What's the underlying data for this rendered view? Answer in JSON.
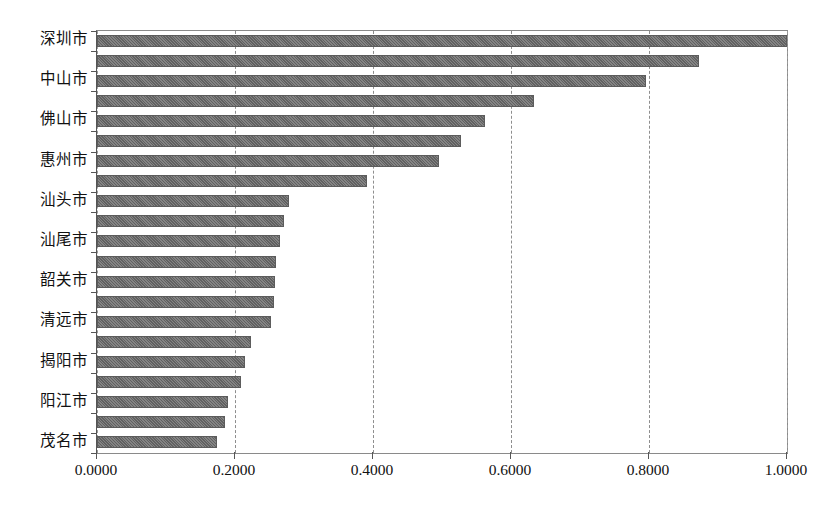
{
  "chart_data": {
    "type": "bar",
    "orientation": "horizontal",
    "title": "",
    "xlabel": "",
    "ylabel": "",
    "xlim": [
      0.0,
      1.0
    ],
    "grid": true,
    "grid_axis": "x",
    "legend": null,
    "bar_color": "#6c6c6c",
    "xticks": [
      0.0,
      0.2,
      0.4,
      0.6,
      0.8,
      1.0
    ],
    "xticklabels": [
      "0.0000",
      "0.2000",
      "0.4000",
      "0.6000",
      "0.8000",
      "1.0000"
    ],
    "yticklabels_visible": [
      "深圳市",
      "中山市",
      "佛山市",
      "惠州市",
      "汕头市",
      "汕尾市",
      "韶关市",
      "清远市",
      "揭阳市",
      "阳江市",
      "茂名市"
    ],
    "categories": [
      "深圳市",
      "",
      "中山市",
      "",
      "佛山市",
      "",
      "惠州市",
      "",
      "汕头市",
      "",
      "汕尾市",
      "",
      "韶关市",
      "",
      "清远市",
      "",
      "揭阳市",
      "",
      "阳江市",
      "",
      "茂名市"
    ],
    "values": [
      1.0,
      0.873,
      0.795,
      0.633,
      0.562,
      0.528,
      0.496,
      0.392,
      0.278,
      0.271,
      0.265,
      0.259,
      0.258,
      0.256,
      0.252,
      0.223,
      0.215,
      0.209,
      0.19,
      0.186,
      0.174
    ]
  },
  "axis": {
    "tick_color": "#555555",
    "grid_color": "#8e8e8e",
    "frame_color": "#8a8a8a"
  }
}
